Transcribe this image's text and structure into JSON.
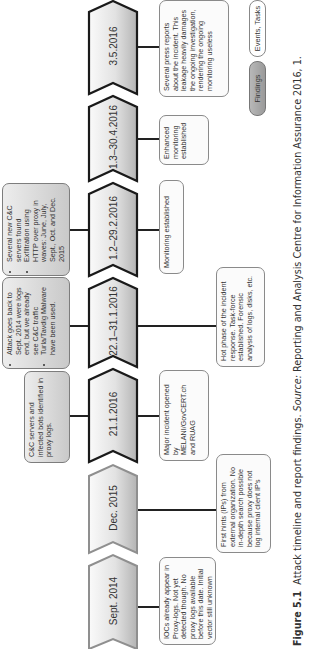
{
  "figure": {
    "orientation": "rotated-90-ccw",
    "caption": {
      "label": "Figure 5.1",
      "title": "Attack timeline and report findings.",
      "source_label": "Source:",
      "source_text": "Reporting and Analysis Centre for Information Assurance 2016, 1."
    }
  },
  "timeline": {
    "segments": [
      {
        "label": "Sept. 2014",
        "outline": "#8f8f8f"
      },
      {
        "label": "Dec. 2015",
        "outline": "#8f8f8f"
      },
      {
        "label": "21.1.2016",
        "outline": "#1a1a1a"
      },
      {
        "label": "22.1–31.1.2016",
        "outline": "#1a1a1a"
      },
      {
        "label": "1.2–29.2.2016",
        "outline": "#1a1a1a"
      },
      {
        "label": "1.3–30.4.2016",
        "outline": "#1a1a1a"
      },
      {
        "label": "3.5.2016",
        "outline": "#1a1a1a"
      }
    ]
  },
  "findings": [
    {
      "segment": "21.1.2016",
      "text": "C&C servers and infected bots identified in proxy logs."
    },
    {
      "segment": "22.1–31.1.2016",
      "bullets": [
        "Attack goes back to Sept. 2014 were logs end, but we already see C&C traffic",
        "Turla/Tavdig Malware have been used."
      ]
    },
    {
      "segment": "1.2–29.2.2016",
      "bullets": [
        "Several new C&C servers found",
        "Exfiltration using HTTP over proxy in waves: June, July, Sept., Oct. and Dec. 2015"
      ]
    }
  ],
  "events": [
    {
      "segment": "Sept. 2014",
      "text": "IOCs already appear in Proxy-logs. Not yet detected though. No proxy logs available before this date. Initial vector still unknown"
    },
    {
      "segment": "Dec. 2015",
      "text": "First hints (IPs) from external organization. No in-depth search possible because proxy does not log internal client IP's"
    },
    {
      "segment": "21.1.2016",
      "text": "Major incident opened by MELANI/GovCERT.ch and RUAG"
    },
    {
      "segment": "22.1–31.1.2016",
      "text": "Hot phase of the incident response. Task-force established. Forensic analysis of logs, disks, etc."
    },
    {
      "segment": "1.2–29.2.2016",
      "text": "Monitoring established"
    },
    {
      "segment": "1.3–30.4.2016",
      "text": "Enhanced monitoring established"
    },
    {
      "segment": "3.5.2016",
      "text": "Several press reports about the incident. This leakage heavily damages the ongoing investigation, rendering the ongoing monitoring useless"
    }
  ],
  "legend": {
    "findings_label": "Findings",
    "events_label": "Events, Tasks",
    "findings_color": "#a8a8a8",
    "events_color": "#ffffff"
  },
  "colors": {
    "segment_fill_light": "#f4f4f4",
    "segment_fill_dark": "#b9b9b9",
    "connector": "#222222",
    "box_border": "#8a8a8a"
  }
}
